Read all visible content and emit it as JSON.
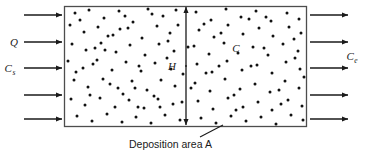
{
  "figure": {
    "type": "schematic-diagram",
    "title": "",
    "colors": {
      "box_border": "#4d4d4d",
      "box_fill": "#ffffff",
      "particle": "#111111",
      "arrow": "#1a1a1a",
      "text": "#1a1a1a"
    }
  },
  "box": {
    "name": "control-volume",
    "x": 64,
    "y": 6,
    "width": 242,
    "height": 120
  },
  "labels": {
    "flow_rate": {
      "text": "Q",
      "sub": ""
    },
    "source_concentration": {
      "text": "C",
      "sub": "s"
    },
    "interior_concentration": {
      "text": "C",
      "sub": ""
    },
    "exit_concentration": {
      "text": "C",
      "sub": "e"
    },
    "height": {
      "text": "H",
      "sub": ""
    },
    "deposition_caption": "Deposition area A"
  },
  "inlet_arrows": {
    "name": "inlet-flow-arrows",
    "count": 5,
    "x_start": 24,
    "x_end": 62,
    "y_positions": [
      15,
      42,
      68,
      95,
      119
    ]
  },
  "outlet_arrows": {
    "name": "outlet-flow-arrows",
    "count": 5,
    "x_start": 310,
    "x_end": 348,
    "y_positions": [
      15,
      42,
      68,
      95,
      119
    ]
  },
  "height_dimension": {
    "name": "height-dimension-arrow",
    "x": 186,
    "y_top": 7,
    "y_bottom": 125,
    "label_x": 172,
    "label_y": 70
  },
  "leader_line": {
    "name": "deposition-leader-line",
    "x1": 200,
    "y1": 137,
    "x2": 223,
    "y2": 125
  },
  "caption_position": {
    "x": 129,
    "y": 148
  },
  "particles": {
    "name": "particle-field",
    "radius": 1.5,
    "count": 150,
    "points": [
      [
        75,
        13
      ],
      [
        89,
        10
      ],
      [
        104,
        18
      ],
      [
        119,
        11
      ],
      [
        133,
        22
      ],
      [
        148,
        9
      ],
      [
        163,
        16
      ],
      [
        176,
        10
      ],
      [
        196,
        12
      ],
      [
        211,
        20
      ],
      [
        226,
        9
      ],
      [
        241,
        17
      ],
      [
        256,
        11
      ],
      [
        271,
        21
      ],
      [
        287,
        13
      ],
      [
        299,
        19
      ],
      [
        70,
        25
      ],
      [
        84,
        32
      ],
      [
        98,
        27
      ],
      [
        113,
        35
      ],
      [
        128,
        28
      ],
      [
        142,
        38
      ],
      [
        157,
        26
      ],
      [
        170,
        33
      ],
      [
        199,
        30
      ],
      [
        214,
        37
      ],
      [
        228,
        25
      ],
      [
        243,
        34
      ],
      [
        259,
        28
      ],
      [
        273,
        36
      ],
      [
        289,
        27
      ],
      [
        301,
        33
      ],
      [
        72,
        44
      ],
      [
        86,
        50
      ],
      [
        101,
        43
      ],
      [
        116,
        52
      ],
      [
        130,
        45
      ],
      [
        145,
        55
      ],
      [
        159,
        44
      ],
      [
        174,
        51
      ],
      [
        194,
        46
      ],
      [
        209,
        54
      ],
      [
        224,
        43
      ],
      [
        238,
        53
      ],
      [
        253,
        47
      ],
      [
        268,
        55
      ],
      [
        283,
        44
      ],
      [
        298,
        51
      ],
      [
        68,
        61
      ],
      [
        83,
        68
      ],
      [
        97,
        60
      ],
      [
        112,
        70
      ],
      [
        126,
        62
      ],
      [
        141,
        71
      ],
      [
        155,
        63
      ],
      [
        171,
        69
      ],
      [
        197,
        64
      ],
      [
        212,
        72
      ],
      [
        227,
        61
      ],
      [
        242,
        70
      ],
      [
        257,
        65
      ],
      [
        272,
        73
      ],
      [
        286,
        62
      ],
      [
        300,
        69
      ],
      [
        74,
        80
      ],
      [
        88,
        87
      ],
      [
        103,
        79
      ],
      [
        118,
        88
      ],
      [
        132,
        81
      ],
      [
        147,
        90
      ],
      [
        161,
        80
      ],
      [
        175,
        86
      ],
      [
        195,
        83
      ],
      [
        210,
        91
      ],
      [
        225,
        79
      ],
      [
        240,
        89
      ],
      [
        255,
        84
      ],
      [
        270,
        92
      ],
      [
        285,
        81
      ],
      [
        299,
        88
      ],
      [
        71,
        99
      ],
      [
        85,
        105
      ],
      [
        100,
        98
      ],
      [
        115,
        107
      ],
      [
        129,
        100
      ],
      [
        144,
        108
      ],
      [
        158,
        99
      ],
      [
        173,
        104
      ],
      [
        198,
        101
      ],
      [
        213,
        109
      ],
      [
        228,
        98
      ],
      [
        243,
        107
      ],
      [
        258,
        102
      ],
      [
        272,
        110
      ],
      [
        288,
        100
      ],
      [
        302,
        106
      ],
      [
        77,
        116
      ],
      [
        92,
        121
      ],
      [
        107,
        114
      ],
      [
        122,
        122
      ],
      [
        136,
        117
      ],
      [
        151,
        123
      ],
      [
        165,
        115
      ],
      [
        180,
        120
      ],
      [
        201,
        118
      ],
      [
        216,
        123
      ],
      [
        231,
        116
      ],
      [
        246,
        121
      ],
      [
        261,
        117
      ],
      [
        276,
        124
      ],
      [
        291,
        115
      ],
      [
        303,
        120
      ],
      [
        80,
        20
      ],
      [
        95,
        48
      ],
      [
        110,
        84
      ],
      [
        125,
        16
      ],
      [
        139,
        66
      ],
      [
        154,
        96
      ],
      [
        168,
        41
      ],
      [
        183,
        74
      ],
      [
        204,
        24
      ],
      [
        219,
        66
      ],
      [
        234,
        95
      ],
      [
        249,
        19
      ],
      [
        264,
        48
      ],
      [
        279,
        90
      ],
      [
        294,
        39
      ],
      [
        304,
        77
      ],
      [
        93,
        64
      ],
      [
        108,
        36
      ],
      [
        123,
        94
      ],
      [
        138,
        107
      ],
      [
        152,
        14
      ],
      [
        167,
        58
      ],
      [
        182,
        102
      ],
      [
        191,
        88
      ],
      [
        206,
        73
      ],
      [
        221,
        33
      ],
      [
        236,
        110
      ],
      [
        251,
        66
      ],
      [
        266,
        17
      ],
      [
        281,
        104
      ],
      [
        295,
        58
      ],
      [
        76,
        72
      ],
      [
        90,
        95
      ],
      [
        105,
        50
      ],
      [
        120,
        29
      ],
      [
        135,
        88
      ],
      [
        160,
        107
      ],
      [
        178,
        25
      ],
      [
        188,
        47
      ]
    ]
  }
}
